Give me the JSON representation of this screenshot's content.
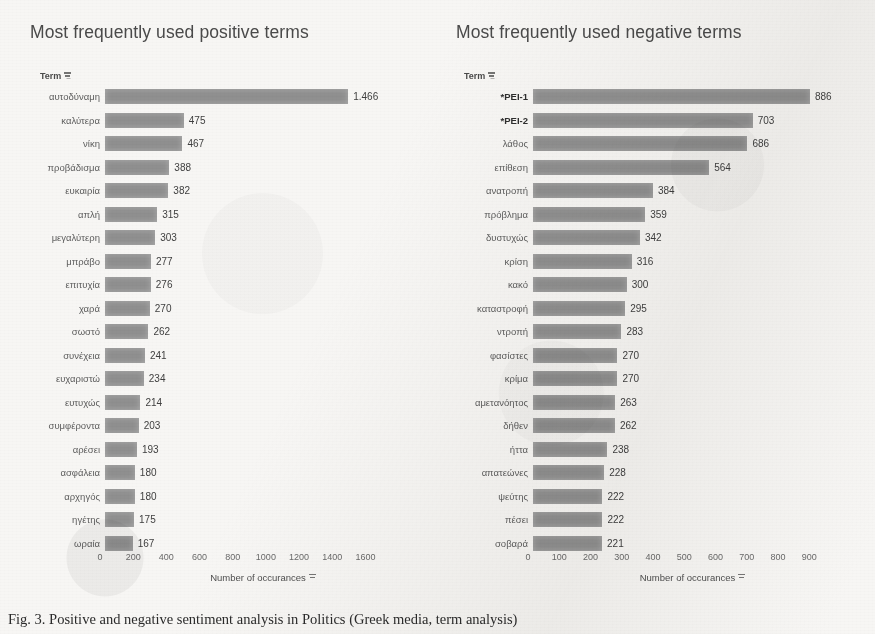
{
  "caption": "Fig. 3. Positive and negative sentiment analysis in Politics (Greek media, term analysis)",
  "axis": {
    "title": "Number of occurances",
    "filter_icon": "filter-icon"
  },
  "charts": [
    {
      "title": "Most frequently used positive terms",
      "term_header": "Term",
      "ticks": [
        0,
        200,
        400,
        600,
        800,
        1000,
        1200,
        1400,
        1600
      ],
      "xmax": 1700,
      "items": [
        {
          "term": "αυτοδύναμη",
          "value": 1466,
          "label": "1.466",
          "bold": false
        },
        {
          "term": "καλύτερα",
          "value": 475,
          "label": "475",
          "bold": false
        },
        {
          "term": "νίκη",
          "value": 467,
          "label": "467",
          "bold": false
        },
        {
          "term": "προβάδισμα",
          "value": 388,
          "label": "388",
          "bold": false
        },
        {
          "term": "ευκαιρία",
          "value": 382,
          "label": "382",
          "bold": false
        },
        {
          "term": "απλή",
          "value": 315,
          "label": "315",
          "bold": false
        },
        {
          "term": "μεγαλύτερη",
          "value": 303,
          "label": "303",
          "bold": false
        },
        {
          "term": "μπράβο",
          "value": 277,
          "label": "277",
          "bold": false
        },
        {
          "term": "επιτυχία",
          "value": 276,
          "label": "276",
          "bold": false
        },
        {
          "term": "χαρά",
          "value": 270,
          "label": "270",
          "bold": false
        },
        {
          "term": "σωστό",
          "value": 262,
          "label": "262",
          "bold": false
        },
        {
          "term": "συνέχεια",
          "value": 241,
          "label": "241",
          "bold": false
        },
        {
          "term": "ευχαριστώ",
          "value": 234,
          "label": "234",
          "bold": false
        },
        {
          "term": "ευτυχώς",
          "value": 214,
          "label": "214",
          "bold": false
        },
        {
          "term": "συμφέροντα",
          "value": 203,
          "label": "203",
          "bold": false
        },
        {
          "term": "αρέσει",
          "value": 193,
          "label": "193",
          "bold": false
        },
        {
          "term": "ασφάλεια",
          "value": 180,
          "label": "180",
          "bold": false
        },
        {
          "term": "αρχηγός",
          "value": 180,
          "label": "180",
          "bold": false
        },
        {
          "term": "ηγέτης",
          "value": 175,
          "label": "175",
          "bold": false
        },
        {
          "term": "ωραία",
          "value": 167,
          "label": "167",
          "bold": false
        }
      ]
    },
    {
      "title": "Most frequently used negative terms",
      "term_header": "Term",
      "ticks": [
        0,
        100,
        200,
        300,
        400,
        500,
        600,
        700,
        800,
        900
      ],
      "xmax": 960,
      "items": [
        {
          "term": "*ΡΕΙ-1",
          "value": 886,
          "label": "886",
          "bold": true
        },
        {
          "term": "*ΡΕΙ-2",
          "value": 703,
          "label": "703",
          "bold": true
        },
        {
          "term": "λάθος",
          "value": 686,
          "label": "686",
          "bold": false
        },
        {
          "term": "επίθεση",
          "value": 564,
          "label": "564",
          "bold": false
        },
        {
          "term": "ανατροπή",
          "value": 384,
          "label": "384",
          "bold": false
        },
        {
          "term": "πρόβλημα",
          "value": 359,
          "label": "359",
          "bold": false
        },
        {
          "term": "δυστυχώς",
          "value": 342,
          "label": "342",
          "bold": false
        },
        {
          "term": "κρίση",
          "value": 316,
          "label": "316",
          "bold": false
        },
        {
          "term": "κακό",
          "value": 300,
          "label": "300",
          "bold": false
        },
        {
          "term": "καταστροφή",
          "value": 295,
          "label": "295",
          "bold": false
        },
        {
          "term": "ντροπή",
          "value": 283,
          "label": "283",
          "bold": false
        },
        {
          "term": "φασίστες",
          "value": 270,
          "label": "270",
          "bold": false
        },
        {
          "term": "κρίμα",
          "value": 270,
          "label": "270",
          "bold": false
        },
        {
          "term": "αμετανόητος",
          "value": 263,
          "label": "263",
          "bold": false
        },
        {
          "term": "δήθεν",
          "value": 262,
          "label": "262",
          "bold": false
        },
        {
          "term": "ήττα",
          "value": 238,
          "label": "238",
          "bold": false
        },
        {
          "term": "απατεώνες",
          "value": 228,
          "label": "228",
          "bold": false
        },
        {
          "term": "ψεύτης",
          "value": 222,
          "label": "222",
          "bold": false
        },
        {
          "term": "πέσει",
          "value": 222,
          "label": "222",
          "bold": false
        },
        {
          "term": "σοβαρά",
          "value": 221,
          "label": "221",
          "bold": false
        }
      ]
    }
  ],
  "chart_data": [
    {
      "type": "bar",
      "orientation": "horizontal",
      "title": "Most frequently used positive terms",
      "xlabel": "Number of occurances",
      "ylabel": "Term",
      "xlim": [
        0,
        1700
      ],
      "xticks": [
        0,
        200,
        400,
        600,
        800,
        1000,
        1200,
        1400,
        1600
      ],
      "grid": false,
      "legend": "none",
      "bar_color": "#8f8f8f",
      "categories": [
        "αυτοδύναμη",
        "καλύτερα",
        "νίκη",
        "προβάδισμα",
        "ευκαιρία",
        "απλή",
        "μεγαλύτερη",
        "μπράβο",
        "επιτυχία",
        "χαρά",
        "σωστό",
        "συνέχεια",
        "ευχαριστώ",
        "ευτυχώς",
        "συμφέροντα",
        "αρέσει",
        "ασφάλεια",
        "αρχηγός",
        "ηγέτης",
        "ωραία"
      ],
      "values": [
        1466,
        475,
        467,
        388,
        382,
        315,
        303,
        277,
        276,
        270,
        262,
        241,
        234,
        214,
        203,
        193,
        180,
        180,
        175,
        167
      ],
      "data_labels": [
        "1.466",
        "475",
        "467",
        "388",
        "382",
        "315",
        "303",
        "277",
        "276",
        "270",
        "262",
        "241",
        "234",
        "214",
        "203",
        "193",
        "180",
        "180",
        "175",
        "167"
      ]
    },
    {
      "type": "bar",
      "orientation": "horizontal",
      "title": "Most frequently used negative terms",
      "xlabel": "Number of occurances",
      "ylabel": "Term",
      "xlim": [
        0,
        960
      ],
      "xticks": [
        0,
        100,
        200,
        300,
        400,
        500,
        600,
        700,
        800,
        900
      ],
      "grid": false,
      "legend": "none",
      "bar_color": "#8f8f8f",
      "categories": [
        "*ΡΕΙ-1",
        "*ΡΕΙ-2",
        "λάθος",
        "επίθεση",
        "ανατροπή",
        "πρόβλημα",
        "δυστυχώς",
        "κρίση",
        "κακό",
        "καταστροφή",
        "ντροπή",
        "φασίστες",
        "κρίμα",
        "αμετανόητος",
        "δήθεν",
        "ήττα",
        "απατεώνες",
        "ψεύτης",
        "πέσει",
        "σοβαρά"
      ],
      "values": [
        886,
        703,
        686,
        564,
        384,
        359,
        342,
        316,
        300,
        295,
        283,
        270,
        270,
        263,
        262,
        238,
        228,
        222,
        222,
        221
      ],
      "data_labels": [
        "886",
        "703",
        "686",
        "564",
        "384",
        "359",
        "342",
        "316",
        "300",
        "295",
        "283",
        "270",
        "270",
        "263",
        "262",
        "238",
        "228",
        "222",
        "222",
        "221"
      ]
    }
  ]
}
